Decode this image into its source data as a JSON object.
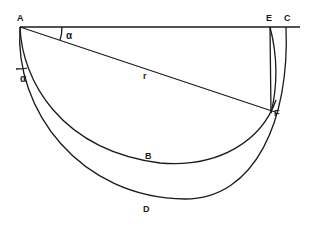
{
  "diagram": {
    "type": "geometry-construction",
    "points": {
      "A": {
        "label": "A",
        "x": 20,
        "y": 27
      },
      "E": {
        "label": "E",
        "x": 270,
        "y": 27
      },
      "C": {
        "label": "C",
        "x": 286,
        "y": 27
      },
      "F": {
        "label": "F",
        "x": 273,
        "y": 110
      },
      "B": {
        "label": "B",
        "x": 160,
        "y": 163
      },
      "D": {
        "label": "D",
        "x": 185,
        "y": 199
      }
    },
    "labels": {
      "A": "A",
      "E": "E",
      "C": "C",
      "F": "F",
      "B": "B",
      "D": "D",
      "r": "r",
      "alpha_top": "α",
      "alpha_left": "α"
    },
    "elements": [
      {
        "id": "horizontal-line",
        "from": "A",
        "to": "beyond C"
      },
      {
        "id": "chord-AF",
        "from": "A",
        "to": "F",
        "label": "r"
      },
      {
        "id": "arc-ABF",
        "through": [
          "A",
          "B",
          "F"
        ]
      },
      {
        "id": "arc-ADC",
        "through": [
          "A",
          "D",
          "C"
        ]
      },
      {
        "id": "segment-EF",
        "from": "E",
        "to": "F"
      },
      {
        "id": "arc-EF",
        "from": "E",
        "to": "F"
      }
    ],
    "angles": [
      {
        "label": "α",
        "between": [
          "line AE",
          "chord AF"
        ],
        "vertex": "A"
      },
      {
        "label": "α",
        "between": [
          "vertical at A",
          "tangent of arc ABF"
        ],
        "vertex": "A"
      }
    ]
  }
}
